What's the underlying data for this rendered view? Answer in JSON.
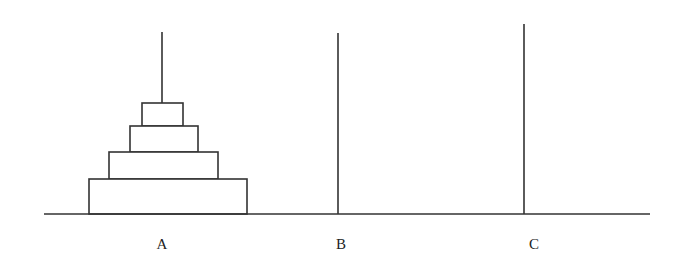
{
  "diagram": {
    "stroke_color": "#333333",
    "ground": {
      "x1": 44,
      "x2": 650,
      "y": 214
    },
    "pegs": [
      {
        "id": "A",
        "label": "A",
        "x": 162,
        "top": 32,
        "label_x": 162
      },
      {
        "id": "B",
        "label": "B",
        "x": 338,
        "top": 33,
        "label_x": 341
      },
      {
        "id": "C",
        "label": "C",
        "x": 524,
        "top": 24,
        "label_x": 534
      }
    ],
    "disks": [
      {
        "peg": "A",
        "size": 1,
        "x": 142,
        "y": 103,
        "w": 41,
        "h": 23
      },
      {
        "peg": "A",
        "size": 2,
        "x": 130,
        "y": 126,
        "w": 68,
        "h": 26
      },
      {
        "peg": "A",
        "size": 3,
        "x": 109,
        "y": 152,
        "w": 109,
        "h": 27
      },
      {
        "peg": "A",
        "size": 4,
        "x": 89,
        "y": 179,
        "w": 158,
        "h": 35
      }
    ]
  }
}
